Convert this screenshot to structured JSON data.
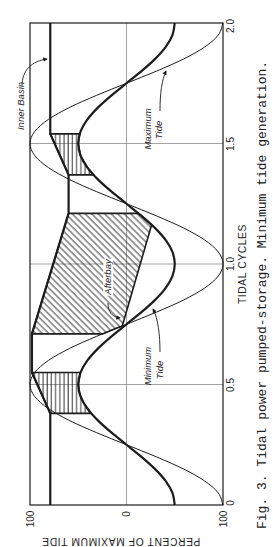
{
  "figure": {
    "caption": "Fig. 3.  Tidal power pumped-storage.  Minimum tide generation."
  },
  "chart_data": {
    "type": "line",
    "title": "Fig. 3. Tidal power pumped-storage. Minimum tide generation.",
    "orientation": "rotated 90 degrees counter-clockwise (x axis runs bottom-to-top along right side)",
    "xlabel": "TIDAL CYCLES",
    "ylabel": "PERCENT OF MAXIMUM TIDE",
    "xlim": [
      0,
      2.0
    ],
    "ylim": [
      -100,
      100
    ],
    "x_ticks": [
      0,
      0.5,
      1.0,
      1.5,
      2.0
    ],
    "x_tick_labels": [
      "0",
      "0.5",
      "1.0",
      "1.5",
      "2.0"
    ],
    "y_ticks": [
      100,
      0,
      -100
    ],
    "y_tick_labels": [
      "100",
      "0",
      "100"
    ],
    "grid": {
      "x": [
        0.5,
        1.0,
        1.5
      ],
      "y": [
        0
      ]
    },
    "legend": "none (inline labels with leader arrows)",
    "x": [
      0,
      0.05,
      0.1,
      0.15,
      0.2,
      0.25,
      0.3,
      0.35,
      0.4,
      0.45,
      0.5,
      0.55,
      0.6,
      0.65,
      0.7,
      0.75,
      0.8,
      0.85,
      0.9,
      0.95,
      1.0,
      1.05,
      1.1,
      1.15,
      1.2,
      1.25,
      1.3,
      1.35,
      1.4,
      1.45,
      1.5,
      1.55,
      1.6,
      1.65,
      1.7,
      1.75,
      1.8,
      1.85,
      1.9,
      1.95,
      2.0
    ],
    "series": [
      {
        "name": "Maximum Tide",
        "line": "thin",
        "values": [
          -100,
          -95.1,
          -80.9,
          -58.8,
          -30.9,
          0,
          30.9,
          58.8,
          80.9,
          95.1,
          100,
          95.1,
          80.9,
          58.8,
          30.9,
          0,
          -30.9,
          -58.8,
          -80.9,
          -95.1,
          -100,
          -95.1,
          -80.9,
          -58.8,
          -30.9,
          0,
          30.9,
          58.8,
          80.9,
          95.1,
          100,
          95.1,
          80.9,
          58.8,
          30.9,
          0,
          -30.9,
          -58.8,
          -80.9,
          -95.1,
          -100
        ]
      },
      {
        "name": "Minimum Tide",
        "line": "thick",
        "values": [
          -50,
          -47.6,
          -40.5,
          -29.4,
          -15.5,
          0,
          15.5,
          29.4,
          40.5,
          47.6,
          50,
          47.6,
          40.5,
          29.4,
          15.5,
          0,
          -15.5,
          -29.4,
          -40.5,
          -47.6,
          -50,
          -47.6,
          -40.5,
          -29.4,
          -15.5,
          0,
          15.5,
          29.4,
          40.5,
          47.6,
          50,
          47.6,
          40.5,
          29.4,
          15.5,
          0,
          -15.5,
          -29.4,
          -40.5,
          -47.6,
          -50
        ]
      },
      {
        "name": "Inner Basin",
        "line": "thick",
        "points": [
          [
            0,
            79
          ],
          [
            0.38,
            79
          ],
          [
            0.55,
            98
          ],
          [
            0.71,
            98
          ],
          [
            1.21,
            60
          ],
          [
            1.37,
            60
          ],
          [
            1.54,
            79
          ],
          [
            2.0,
            79
          ]
        ]
      }
    ],
    "regions": [
      {
        "name": "Afterbay",
        "hatch": "diagonal",
        "points": [
          [
            0.71,
            98
          ],
          [
            0.71,
            25
          ],
          [
            0.72,
            18.7
          ],
          [
            0.73,
            12.5
          ],
          [
            0.743,
            4.4
          ],
          [
            1.162,
            -26
          ],
          [
            1.18,
            -21.3
          ],
          [
            1.195,
            -16.9
          ],
          [
            1.21,
            -12.4
          ],
          [
            1.21,
            60
          ]
        ]
      },
      {
        "name": "hatched area (0.38-0.55 cycles)",
        "hatch": "vertical",
        "points": [
          [
            0.38,
            79
          ],
          [
            0.38,
            36.5
          ],
          [
            0.42,
            43.8
          ],
          [
            0.46,
            48.4
          ],
          [
            0.5,
            50
          ],
          [
            0.55,
            47.6
          ],
          [
            0.55,
            98
          ]
        ]
      },
      {
        "name": "hatched area (1.37-1.54 cycles)",
        "hatch": "vertical",
        "points": [
          [
            1.37,
            60
          ],
          [
            1.37,
            34.2
          ],
          [
            1.4,
            40.5
          ],
          [
            1.45,
            47.6
          ],
          [
            1.5,
            50
          ],
          [
            1.54,
            48.4
          ],
          [
            1.54,
            79
          ]
        ]
      }
    ],
    "annotations": {
      "inner_basin": "Inner Basin",
      "maximum_tide": [
        "Maximum",
        "Tide"
      ],
      "minimum_tide": [
        "Minimum",
        "Tide"
      ],
      "afterbay": "Afterbay"
    }
  }
}
